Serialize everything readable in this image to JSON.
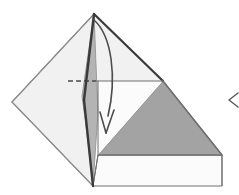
{
  "figure": {
    "type": "origami-instruction-diagram",
    "width": 239,
    "height": 195,
    "background": "#ffffff"
  },
  "palette": {
    "paper_front_light": "#f1f1f1",
    "paper_back_pale": "#e9e9e9",
    "paper_mid_gray": "#b4b4b4",
    "paper_dark_gray": "#a3a3a3",
    "paper_white": "#fbfbfb",
    "outline_dark": "#3a3a3a",
    "outline_medium": "#6e6e6e",
    "outline_light": "#8a8a8a",
    "fold_dashed": "#4a4a4a",
    "arrow_stroke": "#4d4d4d",
    "chevron_stroke": "#5a5a5a"
  },
  "geometry": {
    "apex": {
      "x": 94,
      "y": 14
    },
    "left_vertex": {
      "x": 12,
      "y": 102
    },
    "bottom_vertex": {
      "x": 93,
      "y": 186
    },
    "right_corner": {
      "x": 222,
      "y": 155
    },
    "mid_right": {
      "x": 163,
      "y": 81
    },
    "crease_y": 81,
    "bottom_band_top": 155,
    "bottom_band_bottom": 186
  },
  "shapes": {
    "back_flap_label": "back-flap-pale-quad",
    "back_flap_points": "12,102 94,14 86,96 81,130",
    "left_wing_label": "left-wing-light",
    "left_wing_points": "12,102 94,14 90,110 93,186",
    "spine_sliver_label": "spine-sliver-mid-gray",
    "spine_sliver_points": "94,14 98,112 93,186 86,126 82,96",
    "upper_right_face_label": "upper-right-face-light",
    "upper_right_face_points": "94,14 163,81 98,81",
    "lower_white_face_label": "lower-white-panel",
    "lower_white_face_points": "98,81 163,81 98,155",
    "dark_triangle_label": "dark-gray-triangle",
    "dark_triangle_points": "163,81 222,155 98,155",
    "bottom_band_label": "bottom-white-band",
    "bottom_band_points": "93,186 98,155 222,155 222,186"
  },
  "lines": {
    "crease_dashed": {
      "name": "hidden-crease-dashed",
      "x1": 68,
      "y1": 81,
      "x2": 96,
      "y2": 81,
      "dash": "5,3"
    },
    "crease_solid": {
      "name": "horizontal-crease-line",
      "x1": 96,
      "y1": 81,
      "x2": 163,
      "y2": 81
    },
    "vertical_crease": {
      "name": "vertical-crease-line",
      "x1": 98,
      "y1": 81,
      "x2": 98,
      "y2": 155
    },
    "valley_left_edge": {
      "name": "left-outer-edge",
      "x1": 12,
      "y1": 102,
      "x2": 94,
      "y2": 14
    },
    "valley_bottom_edge": {
      "name": "left-lower-edge",
      "x1": 12,
      "y1": 102,
      "x2": 93,
      "y2": 186
    },
    "right_upper_edge": {
      "name": "apex-to-mid-right-edge",
      "x1": 94,
      "y1": 14,
      "x2": 163,
      "y2": 81
    },
    "right_lower_edge": {
      "name": "mid-right-to-corner-edge",
      "x1": 163,
      "y1": 81,
      "x2": 222,
      "y2": 155
    }
  },
  "arrow": {
    "name": "fold-direction-arrow",
    "description": "curved valley-fold arrow from apex sweeping right then down",
    "path": "M 94,20 C 112,36 117,78 108,116",
    "head_left": "100,112 106,133",
    "head_right": "114,110 106,133",
    "stroke_width": 1.6
  },
  "chevron": {
    "name": "page-edge-chevron",
    "symbol": "<",
    "points": "238,93 229,100 238,107",
    "stroke_width": 1.5
  },
  "labels": {
    "figure_caption": "",
    "step_number": ""
  }
}
